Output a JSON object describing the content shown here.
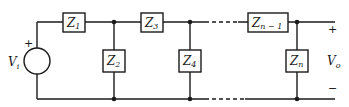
{
  "diagram": {
    "type": "ladder-network",
    "source": {
      "label": "V",
      "subscript": "i",
      "plus": "+"
    },
    "output": {
      "label": "V",
      "subscript": "o",
      "plus": "+",
      "minus": "−"
    },
    "series_impedances": [
      {
        "label": "Z",
        "subscript": "1"
      },
      {
        "label": "Z",
        "subscript": "3"
      },
      {
        "label": "Z",
        "subscript": "n − 1"
      }
    ],
    "shunt_impedances": [
      {
        "label": "Z",
        "subscript": "2"
      },
      {
        "label": "Z",
        "subscript": "4"
      },
      {
        "label": "Z",
        "subscript": "n"
      }
    ]
  }
}
